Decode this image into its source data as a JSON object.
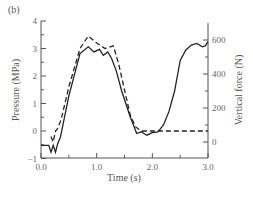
{
  "chart_data": {
    "type": "line",
    "panel_label": "(b)",
    "title": "",
    "xlabel": "Time (s)",
    "ylabel_left": "Pressure (MPa)",
    "ylabel_right": "Vertical force (N)",
    "xlim": [
      0.0,
      3.0
    ],
    "ylim_left": [
      -1,
      4
    ],
    "ylim_right": [
      0,
      600
    ],
    "x_ticks": [
      "0.0",
      "1.0",
      "2.0",
      "3.0"
    ],
    "y_left_ticks": [
      "−1",
      "0",
      "1",
      "2",
      "3",
      "4"
    ],
    "y_right_ticks": [
      "0",
      "200",
      "400",
      "600"
    ],
    "grid": false,
    "legend": null,
    "series": [
      {
        "name": "Vertical force",
        "style": "solid",
        "axis": "right",
        "x": [
          0.0,
          0.14,
          0.18,
          0.22,
          0.26,
          0.3,
          0.35,
          0.5,
          0.7,
          0.85,
          0.95,
          1.05,
          1.12,
          1.2,
          1.27,
          1.35,
          1.45,
          1.6,
          1.72,
          1.8,
          1.9,
          2.0,
          2.1,
          2.2,
          2.3,
          2.4,
          2.5,
          2.6,
          2.7,
          2.8,
          2.9,
          2.95,
          3.0
        ],
        "values": [
          -20,
          -20,
          -60,
          -20,
          -60,
          -10,
          30,
          270,
          520,
          560,
          530,
          545,
          510,
          530,
          490,
          420,
          300,
          150,
          50,
          60,
          40,
          55,
          60,
          100,
          180,
          300,
          480,
          540,
          570,
          580,
          560,
          565,
          590
        ]
      },
      {
        "name": "Pressure",
        "style": "dashed",
        "axis": "left",
        "x": [
          0.18,
          0.22,
          0.26,
          0.3,
          0.36,
          0.5,
          0.7,
          0.85,
          1.0,
          1.15,
          1.3,
          1.4,
          1.5,
          1.6,
          1.7,
          1.8,
          1.9,
          2.0,
          2.5,
          3.0
        ],
        "values": [
          -0.2,
          -0.4,
          0.0,
          0.1,
          0.4,
          1.6,
          3.0,
          3.45,
          3.2,
          3.0,
          3.1,
          2.4,
          1.5,
          0.6,
          0.15,
          0.0,
          0.0,
          0.0,
          0.0,
          0.0
        ]
      }
    ]
  }
}
